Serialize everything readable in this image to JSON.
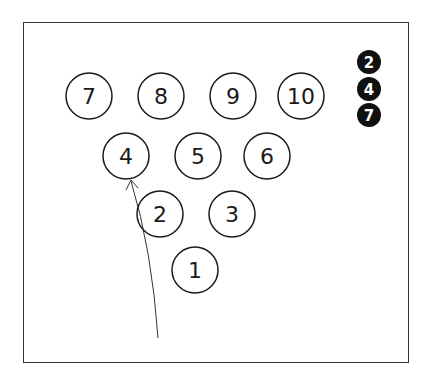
{
  "diagram": {
    "title": "",
    "pins": [
      {
        "label": "7",
        "x": 89,
        "y": 96
      },
      {
        "label": "8",
        "x": 161,
        "y": 96
      },
      {
        "label": "9",
        "x": 233,
        "y": 96
      },
      {
        "label": "10",
        "x": 301,
        "y": 96
      },
      {
        "label": "4",
        "x": 126,
        "y": 156
      },
      {
        "label": "5",
        "x": 198,
        "y": 156
      },
      {
        "label": "6",
        "x": 267,
        "y": 156
      },
      {
        "label": "2",
        "x": 160,
        "y": 214
      },
      {
        "label": "3",
        "x": 232,
        "y": 214
      },
      {
        "label": "1",
        "x": 195,
        "y": 270
      }
    ],
    "markers": [
      {
        "label": "2",
        "x": 369,
        "y": 62
      },
      {
        "label": "4",
        "x": 369,
        "y": 89
      },
      {
        "label": "7",
        "x": 369,
        "y": 115
      }
    ],
    "arrow": {
      "from": "lane",
      "to": "4"
    },
    "colors": {
      "stroke": "#1a1a1a",
      "marker_fill": "#111111",
      "marker_text": "#ffffff"
    }
  }
}
